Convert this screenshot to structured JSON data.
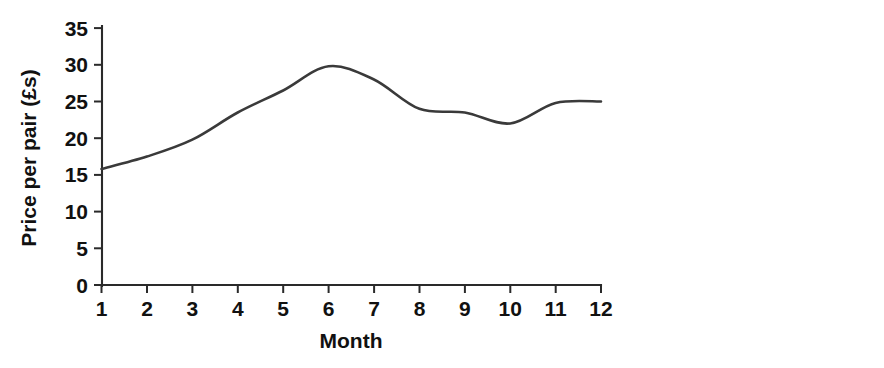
{
  "chart_data": {
    "type": "line",
    "title": "",
    "xlabel": "Month",
    "ylabel": "Price per pair (£s)",
    "x": [
      1,
      2,
      3,
      4,
      5,
      6,
      7,
      8,
      9,
      10,
      11,
      12
    ],
    "xticklabels": [
      "1",
      "2",
      "3",
      "4",
      "5",
      "6",
      "7",
      "8",
      "9",
      "10",
      "11",
      "12"
    ],
    "yticks": [
      0,
      5,
      10,
      15,
      20,
      25,
      30,
      35
    ],
    "yticklabels": [
      "0",
      "5",
      "10",
      "15",
      "20",
      "25",
      "30",
      "35"
    ],
    "xlim": [
      1,
      12
    ],
    "ylim": [
      0,
      35
    ],
    "grid": false,
    "legend": null,
    "series": [
      {
        "name": "Price per pair",
        "color": "#3a3a3a",
        "values": [
          15.8,
          17.5,
          19.8,
          23.5,
          26.5,
          29.8,
          28.0,
          24.0,
          23.5,
          22.0,
          24.8,
          25.0
        ]
      }
    ]
  },
  "axes": {
    "y_title": "Price per pair (£s)",
    "x_title": "Month"
  }
}
